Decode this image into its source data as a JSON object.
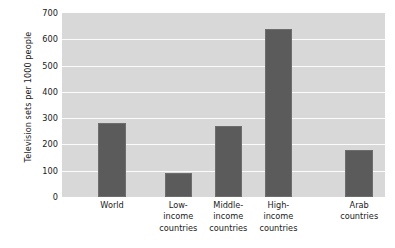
{
  "chart_data": {
    "type": "bar",
    "title": "",
    "xlabel": "",
    "ylabel": "Television sets per 1000 people",
    "ylim": [
      0,
      700
    ],
    "ytick_step": 100,
    "yticks": [
      700,
      600,
      500,
      400,
      300,
      200,
      100,
      0
    ],
    "grid": true,
    "legend": "none",
    "categories": [
      "World",
      "Low-income countries",
      "Middle-income countries",
      "High-income countries",
      "Arab countries"
    ],
    "category_lines": [
      [
        "World"
      ],
      [
        "Low-",
        "income",
        "countries"
      ],
      [
        "Middle-",
        "income",
        "countries"
      ],
      [
        "High-",
        "income",
        "countries"
      ],
      [
        "Arab",
        "countries"
      ]
    ],
    "values": [
      283,
      90,
      272,
      640,
      178
    ],
    "bar_color": "#5b5b5b",
    "plot_background": "#d8d8d8",
    "gridline_color": "#fbfbfb",
    "page_background": "#ffffff",
    "text_color": "#1a1a1a",
    "bar_centers_pct": [
      15.5,
      36.0,
      51.5,
      67.0,
      92.0
    ],
    "bar_width_pct": 8.5
  }
}
